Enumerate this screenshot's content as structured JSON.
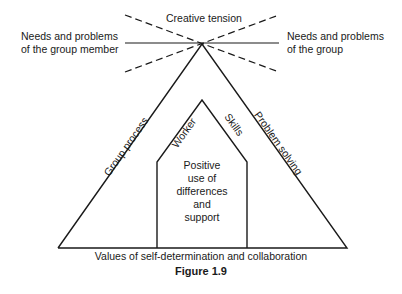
{
  "diagram": {
    "top_label": "Creative tension",
    "left_label_line1": "Needs and problems",
    "left_label_line2": "of the group member",
    "right_label_line1": "Needs and problems",
    "right_label_line2": "of the group",
    "outer_left_side": "Group process",
    "outer_right_side": "Problem solving",
    "inner_left_side": "Worker",
    "inner_right_side": "Skills",
    "center_lines": [
      "Positive",
      "use of",
      "differences",
      "and",
      "support"
    ],
    "base_label": "Values of self-determination and collaboration",
    "figure_caption": "Figure 1.9"
  }
}
